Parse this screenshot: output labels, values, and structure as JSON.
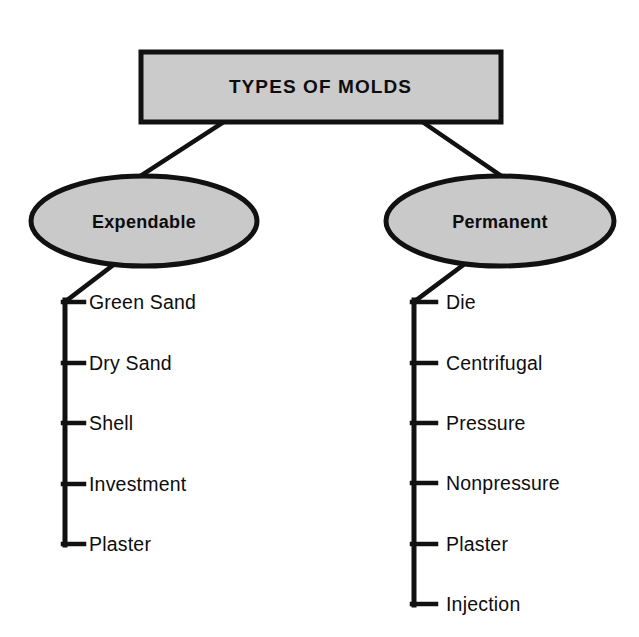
{
  "diagram": {
    "title": "TYPES OF MOLDS",
    "root": {
      "label": "TYPES OF MOLDS",
      "shape": "rectangle",
      "fill": "#cbcbcb",
      "stroke": "#111111"
    },
    "branches": [
      {
        "id": "expendable",
        "label": "Expendable",
        "shape": "ellipse",
        "fill": "#c9c9c9",
        "stroke": "#111111",
        "items": [
          {
            "label": "Green Sand"
          },
          {
            "label": "Dry Sand"
          },
          {
            "label": "Shell"
          },
          {
            "label": "Investment"
          },
          {
            "label": "Plaster"
          }
        ]
      },
      {
        "id": "permanent",
        "label": "Permanent",
        "shape": "ellipse",
        "fill": "#c9c9c9",
        "stroke": "#111111",
        "items": [
          {
            "label": "Die"
          },
          {
            "label": "Centrifugal"
          },
          {
            "label": "Pressure"
          },
          {
            "label": "Nonpressure"
          },
          {
            "label": "Plaster"
          },
          {
            "label": "Injection"
          }
        ]
      }
    ],
    "colors": {
      "background": "#ffffff",
      "line": "#111111",
      "text": "#0d0d0d",
      "shape_fill": "#c9c9c9"
    }
  }
}
